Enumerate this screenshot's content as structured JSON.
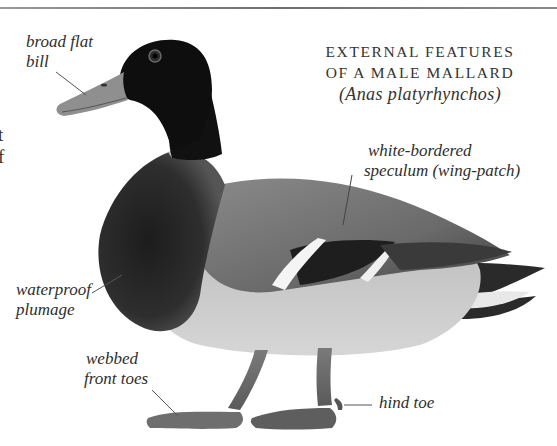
{
  "page": {
    "title_line1": "EXTERNAL FEATURES",
    "title_line2": "OF A MALE MALLARD",
    "scientific_name": "(Anas platyrhynchos)"
  },
  "labels": {
    "bill_line1": "broad flat",
    "bill_line2": "bill",
    "speculum_line1": "white-bordered",
    "speculum_line2": "speculum (wing-patch)",
    "plumage_line1": "waterproof",
    "plumage_line2": "plumage",
    "toes_line1": "webbed",
    "toes_line2": "front toes",
    "hind_toe": "hind toe"
  },
  "clipped_text": {
    "line1": "t",
    "line2": "f"
  },
  "colors": {
    "rule": "#7a7a7a",
    "text": "#2e2e2e",
    "head": "#0e0e0e",
    "body": "#9a9a9a"
  }
}
